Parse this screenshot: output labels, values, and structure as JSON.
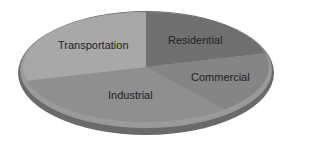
{
  "chart_data": {
    "type": "pie",
    "title": "",
    "categories": [
      "Residential",
      "Commercial",
      "Industrial",
      "Transportation"
    ],
    "values": [
      21,
      18,
      32,
      29
    ],
    "colors": [
      "#707070",
      "#858585",
      "#8f8f8f",
      "#a8a8a8"
    ],
    "legend": "none",
    "style": "3d-oval-grayscale"
  },
  "labels": {
    "residential": "Residential",
    "commercial": "Commercial",
    "industrial": "Industrial",
    "transportation": "Transportation"
  }
}
